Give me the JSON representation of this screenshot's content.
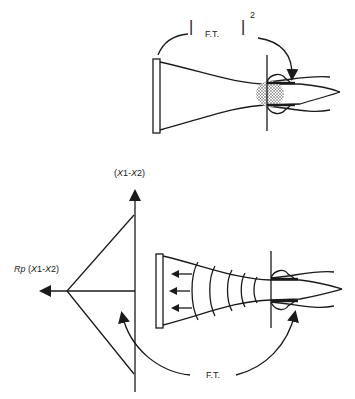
{
  "top_diagram": {
    "label_ft": "F.T.",
    "label_bar_left": "|",
    "label_bar_right": "|",
    "exponent": "2"
  },
  "bottom_diagram": {
    "vertical_axis_label": "(X1-X2)",
    "horizontal_axis_label_prefix": "Rp",
    "horizontal_axis_label_suffix": " (X1-X2)",
    "label_ft": "F.T."
  },
  "colors": {
    "line": "#1a1a1a",
    "stipple": "#888888",
    "background": "#ffffff"
  }
}
